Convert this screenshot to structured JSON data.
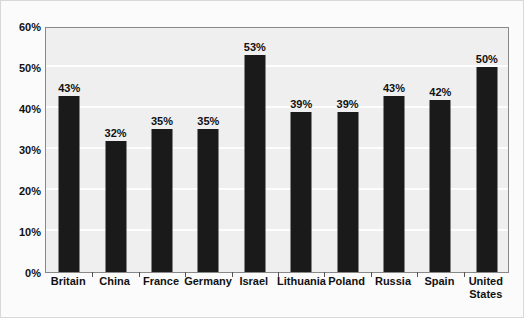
{
  "chart_data": {
    "type": "bar",
    "title": "",
    "subtitle": "",
    "xlabel": "",
    "ylabel": "",
    "categories": [
      "Britain",
      "China",
      "France",
      "Germany",
      "Israel",
      "Lithuania",
      "Poland",
      "Russia",
      "Spain",
      "United States"
    ],
    "values": [
      43,
      32,
      35,
      35,
      53,
      39,
      39,
      43,
      42,
      50
    ],
    "data_labels": [
      "43%",
      "32%",
      "35%",
      "35%",
      "53%",
      "39%",
      "39%",
      "43%",
      "42%",
      "50%"
    ],
    "ylim": [
      0,
      60
    ],
    "ytick_values": [
      0,
      10,
      20,
      30,
      40,
      50,
      60
    ],
    "ytick_labels": [
      "0%",
      "10%",
      "20%",
      "30%",
      "40%",
      "50%",
      "60%"
    ],
    "grid": true,
    "grid_axis": "y",
    "legend": false,
    "legend_position": "none",
    "series": [
      {
        "name": "",
        "values": [
          43,
          32,
          35,
          35,
          53,
          39,
          39,
          43,
          42,
          50
        ],
        "color": "#1a1a1a"
      }
    ],
    "colors": {
      "bar": "#1a1a1a",
      "plot_background": "#efefef",
      "figure_background": "#fbfbfb",
      "gridline": "#fdfdfd",
      "axis": "#888888",
      "text": "#111111"
    }
  }
}
